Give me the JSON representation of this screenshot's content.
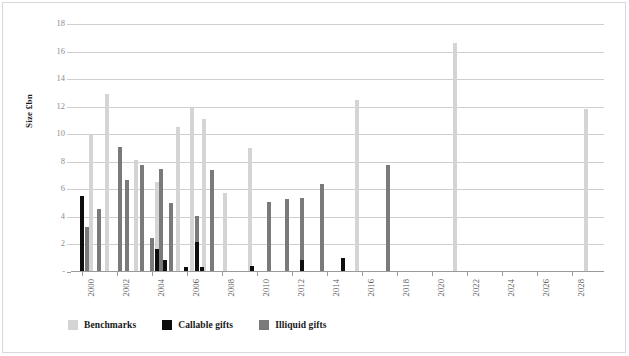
{
  "chart_data": {
    "type": "bar",
    "title": "",
    "xlabel": "",
    "ylabel": "Size £bn",
    "ylim": [
      0,
      18
    ],
    "yticks": [
      0,
      2,
      4,
      6,
      8,
      10,
      12,
      14,
      16,
      18
    ],
    "ytick_labels": [
      "-",
      "2",
      "4",
      "6",
      "8",
      "10",
      "12",
      "14",
      "16",
      "18"
    ],
    "grid": true,
    "legend_position": "bottom-left",
    "xlim": [
      1999.4,
      2029.8
    ],
    "xticks": [
      2000,
      2002,
      2004,
      2006,
      2008,
      2010,
      2012,
      2014,
      2016,
      2018,
      2020,
      2022,
      2024,
      2026,
      2028
    ],
    "xtick_labels": [
      "2000",
      "2002",
      "2004",
      "2006",
      "2008",
      "2010",
      "2012",
      "2014",
      "2016",
      "2018",
      "2020",
      "2022",
      "2024",
      "2026",
      "2028"
    ],
    "colors": {
      "benchmarks": "#d4d4d4",
      "callable_gifts": "#0d0d0d",
      "illiquid_gifts": "#7a7a7a",
      "gridline": "#cfcfcf",
      "axis": "#9a9a9a",
      "tick_text": "#8d8d8d",
      "frame": "#d9d9d9"
    },
    "series": [
      {
        "name": "Benchmarks",
        "color": "#d4d4d4",
        "points": [
          {
            "x": 2000.55,
            "y": 10.0
          },
          {
            "x": 2001.45,
            "y": 12.9
          },
          {
            "x": 2003.1,
            "y": 8.1
          },
          {
            "x": 2004.3,
            "y": 6.5
          },
          {
            "x": 2005.5,
            "y": 10.5
          },
          {
            "x": 2006.3,
            "y": 12.0
          },
          {
            "x": 2007.0,
            "y": 11.1
          },
          {
            "x": 2008.2,
            "y": 5.75
          },
          {
            "x": 2009.6,
            "y": 9.0
          },
          {
            "x": 2015.7,
            "y": 12.5
          },
          {
            "x": 2021.3,
            "y": 16.6
          },
          {
            "x": 2028.8,
            "y": 11.8
          }
        ]
      },
      {
        "name": "Callable gifts",
        "color": "#0d0d0d",
        "points": [
          {
            "x": 2000.0,
            "y": 5.5
          },
          {
            "x": 2004.3,
            "y": 1.7
          },
          {
            "x": 2004.75,
            "y": 0.9
          },
          {
            "x": 2005.95,
            "y": 0.35
          },
          {
            "x": 2006.6,
            "y": 2.15
          },
          {
            "x": 2006.9,
            "y": 0.4
          },
          {
            "x": 2009.75,
            "y": 0.45
          },
          {
            "x": 2012.6,
            "y": 0.9
          },
          {
            "x": 2014.9,
            "y": 1.05
          }
        ]
      },
      {
        "name": "Illiquid gifts",
        "color": "#7a7a7a",
        "points": [
          {
            "x": 2000.3,
            "y": 3.3
          },
          {
            "x": 2001.0,
            "y": 4.55
          },
          {
            "x": 2002.2,
            "y": 9.05
          },
          {
            "x": 2002.6,
            "y": 6.65
          },
          {
            "x": 2003.45,
            "y": 7.75
          },
          {
            "x": 2004.0,
            "y": 2.45
          },
          {
            "x": 2004.55,
            "y": 7.5
          },
          {
            "x": 2005.1,
            "y": 5.0
          },
          {
            "x": 2006.6,
            "y": 4.1
          },
          {
            "x": 2007.45,
            "y": 7.4
          },
          {
            "x": 2010.7,
            "y": 5.1
          },
          {
            "x": 2011.7,
            "y": 5.3
          },
          {
            "x": 2012.6,
            "y": 5.35
          },
          {
            "x": 2013.7,
            "y": 6.4
          },
          {
            "x": 2017.5,
            "y": 7.8
          }
        ]
      }
    ],
    "legend": [
      {
        "label": "Benchmarks",
        "color": "#d4d4d4"
      },
      {
        "label": "Callable gifts",
        "color": "#0d0d0d"
      },
      {
        "label": "Illiquid gifts",
        "color": "#7a7a7a"
      }
    ]
  }
}
